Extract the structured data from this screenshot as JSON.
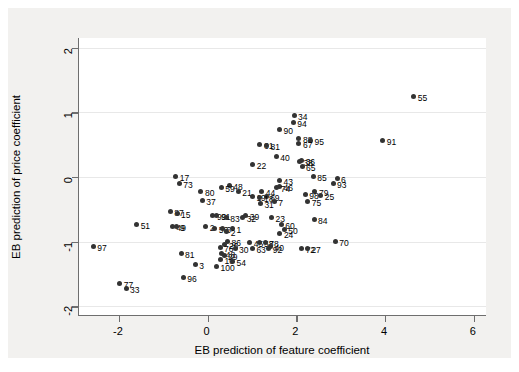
{
  "chart_data": {
    "type": "scatter",
    "title": "",
    "xlabel": "EB prediction of feature coefficient",
    "ylabel": "EB prediction of price coefficient",
    "xlim": [
      -2.9,
      6.3
    ],
    "ylim": [
      -2.15,
      2.15
    ],
    "xticks": [
      -2,
      0,
      2,
      4,
      6
    ],
    "xticklabels": [
      "-2",
      "0",
      "2",
      "4",
      "6"
    ],
    "yticks": [
      -2,
      -1,
      0,
      1,
      2
    ],
    "yticklabels": [
      "-2",
      "-1",
      "0",
      "1",
      "2"
    ],
    "grid": "horizontal",
    "legend": "none",
    "marker_color": "#333333",
    "background_color": "#f2f1ef",
    "plot_background_color": "#ffffff",
    "points": [
      {
        "label": "55",
        "x": 4.65,
        "y": 1.25
      },
      {
        "label": "34",
        "x": 1.95,
        "y": 0.95
      },
      {
        "label": "94",
        "x": 1.93,
        "y": 0.85
      },
      {
        "label": "90",
        "x": 1.62,
        "y": 0.74
      },
      {
        "label": "88",
        "x": 2.06,
        "y": 0.6
      },
      {
        "label": "95",
        "x": 2.32,
        "y": 0.57
      },
      {
        "label": "91",
        "x": 3.95,
        "y": 0.57
      },
      {
        "label": "67",
        "x": 2.06,
        "y": 0.52
      },
      {
        "label": "61",
        "x": 1.18,
        "y": 0.5
      },
      {
        "label": "81",
        "x": 1.33,
        "y": 0.49
      },
      {
        "label": "40",
        "x": 1.55,
        "y": 0.32
      },
      {
        "label": "36",
        "x": 2.12,
        "y": 0.25
      },
      {
        "label": "38",
        "x": 2.07,
        "y": 0.24
      },
      {
        "label": "22",
        "x": 1.02,
        "y": 0.19
      },
      {
        "label": "65",
        "x": 2.13,
        "y": 0.17
      },
      {
        "label": "85",
        "x": 2.38,
        "y": 0.01
      },
      {
        "label": "17",
        "x": -0.72,
        "y": 0.01
      },
      {
        "label": "6",
        "x": 2.92,
        "y": -0.03
      },
      {
        "label": "43",
        "x": 1.62,
        "y": -0.05
      },
      {
        "label": "93",
        "x": 2.83,
        "y": -0.1
      },
      {
        "label": "73",
        "x": -0.64,
        "y": -0.1
      },
      {
        "label": "48",
        "x": 0.49,
        "y": -0.13
      },
      {
        "label": "46",
        "x": 1.62,
        "y": -0.15
      },
      {
        "label": "74",
        "x": 1.56,
        "y": -0.16
      },
      {
        "label": "59",
        "x": 0.31,
        "y": -0.17
      },
      {
        "label": "80",
        "x": -0.15,
        "y": -0.23
      },
      {
        "label": "21",
        "x": 0.69,
        "y": -0.22
      },
      {
        "label": "79",
        "x": 2.42,
        "y": -0.22
      },
      {
        "label": "44",
        "x": 1.22,
        "y": -0.22
      },
      {
        "label": "98",
        "x": 2.2,
        "y": -0.27
      },
      {
        "label": "25",
        "x": 2.55,
        "y": -0.29
      },
      {
        "label": "19",
        "x": 1.01,
        "y": -0.3
      },
      {
        "label": "69",
        "x": 1.32,
        "y": -0.3
      },
      {
        "label": "18",
        "x": 1.18,
        "y": -0.31
      },
      {
        "label": "37",
        "x": -0.12,
        "y": -0.36
      },
      {
        "label": "75",
        "x": 2.26,
        "y": -0.38
      },
      {
        "label": "7",
        "x": 1.5,
        "y": -0.38
      },
      {
        "label": "31",
        "x": 1.19,
        "y": -0.41
      },
      {
        "label": "87",
        "x": -0.84,
        "y": -0.54
      },
      {
        "label": "15",
        "x": -0.69,
        "y": -0.57
      },
      {
        "label": "99",
        "x": 0.12,
        "y": -0.59
      },
      {
        "label": "91b",
        "x": 0.21,
        "y": -0.6
      },
      {
        "label": "39",
        "x": 0.86,
        "y": -0.6
      },
      {
        "label": "32",
        "x": 0.79,
        "y": -0.62
      },
      {
        "label": "83",
        "x": 0.42,
        "y": -0.63
      },
      {
        "label": "23",
        "x": 1.44,
        "y": -0.63
      },
      {
        "label": "84",
        "x": 2.4,
        "y": -0.65
      },
      {
        "label": "51",
        "x": -1.6,
        "y": -0.73
      },
      {
        "label": "60",
        "x": 1.66,
        "y": -0.73
      },
      {
        "label": "49",
        "x": -0.79,
        "y": -0.77
      },
      {
        "label": "9",
        "x": -0.71,
        "y": -0.76
      },
      {
        "label": "2",
        "x": -0.04,
        "y": -0.77
      },
      {
        "label": "56",
        "x": 0.16,
        "y": -0.79
      },
      {
        "label": "6b",
        "x": 0.33,
        "y": -0.8
      },
      {
        "label": "1",
        "x": 0.56,
        "y": -0.79
      },
      {
        "label": "50",
        "x": 1.73,
        "y": -0.81
      },
      {
        "label": "2b",
        "x": 0.43,
        "y": -0.85
      },
      {
        "label": "24",
        "x": 1.63,
        "y": -0.88
      },
      {
        "label": "97",
        "x": -2.58,
        "y": -1.08
      },
      {
        "label": "70",
        "x": 2.88,
        "y": -1.0
      },
      {
        "label": "86",
        "x": 0.45,
        "y": -1.0
      },
      {
        "label": "45",
        "x": 0.95,
        "y": -1.02
      },
      {
        "label": "58",
        "x": 1.18,
        "y": -1.02
      },
      {
        "label": "78",
        "x": 1.3,
        "y": -1.02
      },
      {
        "label": "26",
        "x": 0.39,
        "y": -1.05
      },
      {
        "label": "40b",
        "x": 1.42,
        "y": -1.07
      },
      {
        "label": "76",
        "x": 0.28,
        "y": -1.09
      },
      {
        "label": "30",
        "x": 0.62,
        "y": -1.1
      },
      {
        "label": "63",
        "x": 1.01,
        "y": -1.1
      },
      {
        "label": "92",
        "x": 1.38,
        "y": -1.11
      },
      {
        "label": "72",
        "x": 2.12,
        "y": -1.11
      },
      {
        "label": "27",
        "x": 2.25,
        "y": -1.11
      },
      {
        "label": "81b",
        "x": -0.6,
        "y": -1.18
      },
      {
        "label": "48b",
        "x": 0.32,
        "y": -1.18
      },
      {
        "label": "29",
        "x": 0.37,
        "y": -1.22
      },
      {
        "label": "10",
        "x": 0.29,
        "y": -1.27
      },
      {
        "label": "54",
        "x": 0.56,
        "y": -1.3
      },
      {
        "label": "100",
        "x": 0.2,
        "y": -1.38
      },
      {
        "label": "3",
        "x": -0.28,
        "y": -1.36
      },
      {
        "label": "96",
        "x": -0.55,
        "y": -1.56
      },
      {
        "label": "77",
        "x": -1.98,
        "y": -1.65
      },
      {
        "label": "33",
        "x": -1.84,
        "y": -1.72
      }
    ]
  }
}
